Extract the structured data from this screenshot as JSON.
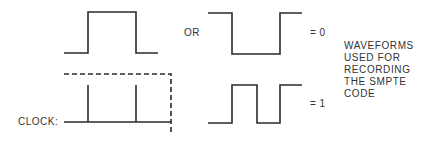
{
  "diagram": {
    "labels": {
      "or": "OR",
      "equals_zero": "= 0",
      "equals_one": "= 1",
      "clock": "CLOCK:"
    },
    "caption": [
      "WAVEFORMS",
      "USED FOR",
      "RECORDING",
      "THE SMPTE",
      "CODE"
    ],
    "colors": {
      "line": "#2a2a2a",
      "background": "#ffffff"
    },
    "waveforms": [
      {
        "name": "zero-variant-a",
        "description": "low-high-low pulse"
      },
      {
        "name": "zero-variant-b",
        "description": "high-low-high pulse"
      },
      {
        "name": "clock",
        "description": "clock baseline with two ticks and dashed bit-cell boundary"
      },
      {
        "name": "one",
        "description": "low-high-low-high waveform (two transitions per bit cell)"
      }
    ]
  }
}
